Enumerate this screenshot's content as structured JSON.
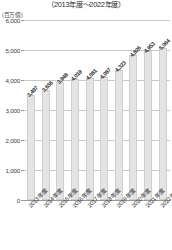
{
  "header": {
    "title": "",
    "subtitle": "（2013年度～2022年度）"
  },
  "axis": {
    "unit_label": "(百万個)",
    "y_ticks": [
      "0",
      "1,000",
      "2,000",
      "3,000",
      "4,000",
      "5,000",
      "6,000"
    ]
  },
  "colors": {
    "bar_fill": "#e4e4e4",
    "bar_stroke": "#cfcfcf",
    "gridline": "#c9c9c9",
    "axis": "#9a9a9a",
    "text": "#2b2b2b"
  },
  "chart_data": {
    "type": "bar",
    "title": "",
    "subtitle": "（2013年度～2022年度）",
    "xlabel": "",
    "ylabel": "(百万個)",
    "ylim": [
      0,
      6000
    ],
    "ytick_step": 1000,
    "grid": true,
    "legend": "none",
    "categories": [
      "2013年度",
      "2014年度",
      "2015年度",
      "2016年度",
      "2017年度",
      "2018年度",
      "2019年度",
      "2020年度",
      "2021年度",
      "2022年度"
    ],
    "values": [
      3497,
      3656,
      3948,
      4019,
      4081,
      4087,
      4323,
      4826,
      4953,
      5064
    ],
    "value_labels": [
      "3,497",
      "3,656",
      "3,948",
      "4,019",
      "4,081",
      "4,087",
      "4,323",
      "4,826",
      "4,953",
      "5,064"
    ]
  }
}
